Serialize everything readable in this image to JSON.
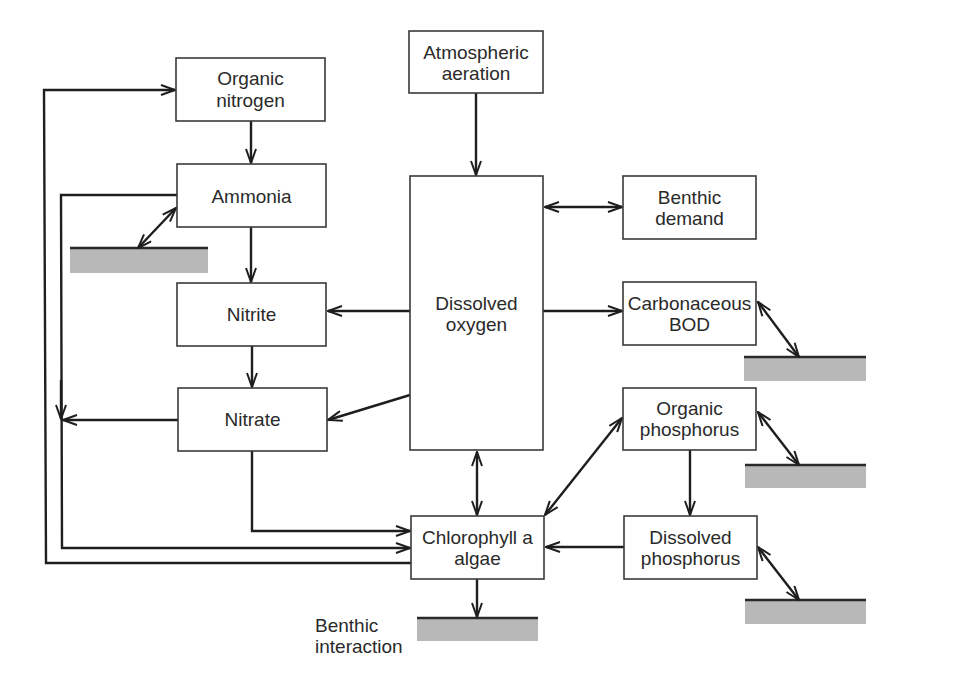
{
  "diagram": {
    "nodes": {
      "organic_nitrogen": {
        "lines": [
          "Organic",
          "nitrogen"
        ]
      },
      "ammonia": {
        "lines": [
          "Ammonia"
        ]
      },
      "nitrite": {
        "lines": [
          "Nitrite"
        ]
      },
      "nitrate": {
        "lines": [
          "Nitrate"
        ]
      },
      "atmospheric_aeration": {
        "lines": [
          "Atmospheric",
          "aeration"
        ]
      },
      "dissolved_oxygen": {
        "lines": [
          "Dissolved",
          "oxygen"
        ]
      },
      "benthic_demand": {
        "lines": [
          "Benthic",
          "demand"
        ]
      },
      "carbonaceous_bod": {
        "lines": [
          "Carbonaceous",
          "BOD"
        ]
      },
      "organic_phosphorus": {
        "lines": [
          "Organic",
          "phosphorus"
        ]
      },
      "dissolved_phosphorus": {
        "lines": [
          "Dissolved",
          "phosphorus"
        ]
      },
      "chlorophyll_algae": {
        "lines": [
          "Chlorophyll a",
          "algae"
        ]
      }
    },
    "labels": {
      "benthic_interaction": [
        "Benthic",
        "interaction"
      ]
    },
    "sediment_bars": [
      "ammonia",
      "carbonaceous_bod",
      "organic_phosphorus",
      "dissolved_phosphorus",
      "chlorophyll_algae"
    ],
    "edges": [
      {
        "from": "organic_nitrogen",
        "to": "ammonia",
        "type": "one-way"
      },
      {
        "from": "ammonia",
        "to": "nitrite",
        "type": "one-way"
      },
      {
        "from": "nitrite",
        "to": "nitrate",
        "type": "one-way"
      },
      {
        "from": "atmospheric_aeration",
        "to": "dissolved_oxygen",
        "type": "one-way"
      },
      {
        "from": "dissolved_oxygen",
        "to": "benthic_demand",
        "type": "two-way"
      },
      {
        "from": "dissolved_oxygen",
        "to": "carbonaceous_bod",
        "type": "one-way"
      },
      {
        "from": "dissolved_oxygen",
        "to": "nitrite",
        "type": "one-way"
      },
      {
        "from": "dissolved_oxygen",
        "to": "nitrate",
        "type": "one-way"
      },
      {
        "from": "dissolved_oxygen",
        "to": "chlorophyll_algae",
        "type": "two-way"
      },
      {
        "from": "organic_phosphorus",
        "to": "dissolved_phosphorus",
        "type": "one-way"
      },
      {
        "from": "organic_phosphorus",
        "to": "chlorophyll_algae",
        "type": "two-way"
      },
      {
        "from": "dissolved_phosphorus",
        "to": "chlorophyll_algae",
        "type": "one-way"
      },
      {
        "from": "nitrate",
        "to": "chlorophyll_algae",
        "type": "one-way"
      },
      {
        "from": "ammonia",
        "to": "chlorophyll_algae",
        "type": "one-way"
      },
      {
        "from": "nitrate",
        "to": "ammonia-loop",
        "type": "one-way"
      },
      {
        "from": "chlorophyll_algae",
        "to": "organic_nitrogen",
        "type": "one-way"
      },
      {
        "from": "ammonia",
        "to": "sediment",
        "type": "two-way"
      },
      {
        "from": "carbonaceous_bod",
        "to": "sediment",
        "type": "two-way"
      },
      {
        "from": "organic_phosphorus",
        "to": "sediment",
        "type": "two-way"
      },
      {
        "from": "dissolved_phosphorus",
        "to": "sediment",
        "type": "two-way"
      },
      {
        "from": "chlorophyll_algae",
        "to": "sediment",
        "type": "one-way"
      }
    ]
  }
}
